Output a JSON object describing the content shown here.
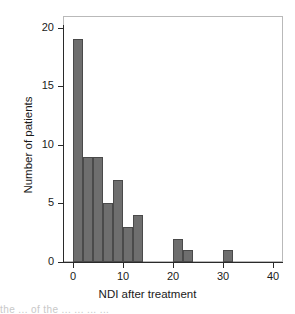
{
  "chart_data": {
    "type": "bar",
    "title": "",
    "subtitle": "",
    "xlabel": "NDI after treatment",
    "ylabel": "Number of patients",
    "xlim": [
      -2,
      42
    ],
    "ylim": [
      0,
      21
    ],
    "xticks": [
      0,
      10,
      20,
      30,
      40
    ],
    "xtick_labels": [
      "0",
      "10",
      "20",
      "30",
      "40"
    ],
    "yticks": [
      0,
      5,
      10,
      15,
      20
    ],
    "ytick_labels": [
      "0",
      "5",
      "10",
      "15",
      "20"
    ],
    "grid": false,
    "legend": null,
    "bin_width": 2,
    "bin_starts": [
      0,
      2,
      4,
      6,
      8,
      10,
      12,
      14,
      16,
      18,
      20,
      22,
      24,
      26,
      28,
      30
    ],
    "categories": [
      "0-2",
      "2-4",
      "4-6",
      "6-8",
      "8-10",
      "10-12",
      "12-14",
      "14-16",
      "16-18",
      "18-20",
      "20-22",
      "22-24",
      "24-26",
      "26-28",
      "28-30",
      "30-32"
    ],
    "values": [
      19,
      9,
      9,
      5,
      7,
      3,
      4,
      0,
      0,
      0,
      2,
      1,
      0,
      0,
      0,
      1
    ],
    "bars": [
      {
        "x0": 0,
        "x1": 2,
        "value": 19
      },
      {
        "x0": 2,
        "x1": 4,
        "value": 9
      },
      {
        "x0": 4,
        "x1": 6,
        "value": 9
      },
      {
        "x0": 6,
        "x1": 8,
        "value": 5
      },
      {
        "x0": 8,
        "x1": 10,
        "value": 7
      },
      {
        "x0": 10,
        "x1": 12,
        "value": 3
      },
      {
        "x0": 12,
        "x1": 14,
        "value": 4
      },
      {
        "x0": 20,
        "x1": 22,
        "value": 2
      },
      {
        "x0": 22,
        "x1": 24,
        "value": 1
      },
      {
        "x0": 30,
        "x1": 32,
        "value": 1
      }
    ],
    "bar_color": "#6e6e6e",
    "bar_edge_color": "#4a4a4a",
    "axis_color": "#2a2a2a",
    "frame_color": "#b9b9b9",
    "total_patients": 60
  },
  "page_bleed_text": "the ... of the ... ... ... ..."
}
